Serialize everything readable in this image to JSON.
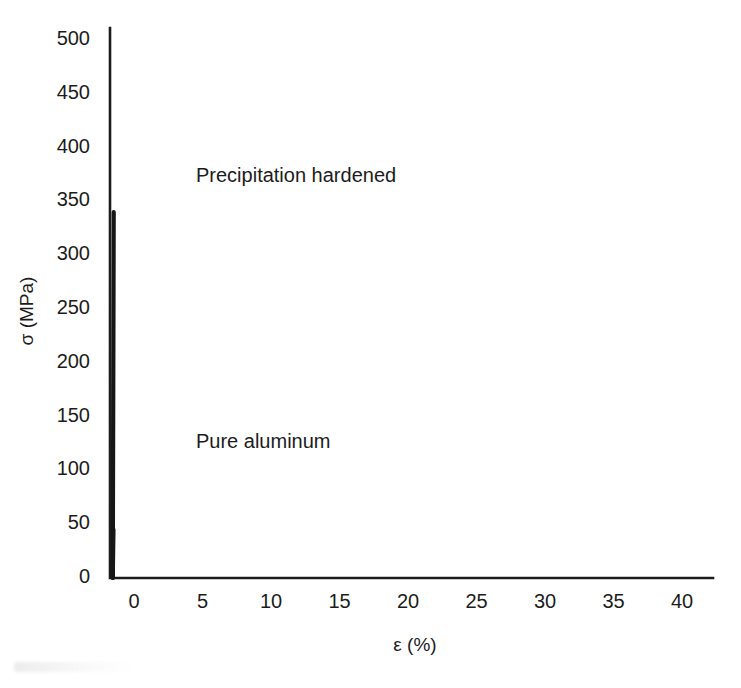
{
  "chart_data": {
    "type": "line",
    "title": "",
    "xlabel": "ε (%)",
    "ylabel": "σ (MPa)",
    "xlim": [
      -1.8,
      42.3
    ],
    "ylim": [
      0,
      512
    ],
    "xticks": [
      0,
      5,
      10,
      15,
      20,
      25,
      30,
      35,
      40
    ],
    "yticks": [
      0,
      50,
      100,
      150,
      200,
      250,
      300,
      350,
      400,
      450,
      500
    ],
    "xtick_labels": [
      "0",
      "5",
      "10",
      "15",
      "20",
      "25",
      "30",
      "35",
      "40"
    ],
    "ytick_labels": [
      "0",
      "50",
      "100",
      "150",
      "200",
      "250",
      "300",
      "350",
      "400",
      "450",
      "500"
    ],
    "grid": false,
    "legend_position": "inline-annotations",
    "line_color": "#161616",
    "axis_color": "#1c1c1c",
    "series": [
      {
        "name": "Precipitation hardened",
        "label_x": 1.3,
        "label_y": 392,
        "yield_strength": 340,
        "tensile_strength": 488,
        "strain_at_peak": 14.0,
        "fracture_strain": 20.7,
        "fracture_stress": 443,
        "points": [
          [
            -1.55,
            0
          ],
          [
            -1.48,
            340
          ],
          [
            -0.6,
            352
          ],
          [
            0.6,
            375
          ],
          [
            1.8,
            398
          ],
          [
            3.0,
            419
          ],
          [
            4.3,
            439
          ],
          [
            5.7,
            456
          ],
          [
            7.2,
            469
          ],
          [
            8.8,
            478
          ],
          [
            10.5,
            484
          ],
          [
            12.2,
            487
          ],
          [
            14.0,
            488
          ],
          [
            15.6,
            485
          ],
          [
            17.0,
            478
          ],
          [
            18.3,
            468
          ],
          [
            19.5,
            457
          ],
          [
            20.7,
            443
          ]
        ]
      },
      {
        "name": "Pure aluminum",
        "label_x": 1.3,
        "label_y": 124,
        "yield_strength": 45,
        "tensile_strength": 106,
        "strain_at_peak": 23.4,
        "fracture_strain": 39.7,
        "fracture_stress": 41,
        "points": [
          [
            -1.55,
            0
          ],
          [
            -1.5,
            45
          ],
          [
            0.0,
            48
          ],
          [
            2.5,
            54
          ],
          [
            5.0,
            61
          ],
          [
            7.5,
            68
          ],
          [
            10.0,
            76
          ],
          [
            12.5,
            83
          ],
          [
            15.0,
            90
          ],
          [
            17.5,
            97
          ],
          [
            20.0,
            102
          ],
          [
            22.0,
            105
          ],
          [
            23.4,
            106
          ],
          [
            25.0,
            105
          ],
          [
            27.0,
            102
          ],
          [
            29.0,
            97
          ],
          [
            31.0,
            90
          ],
          [
            33.0,
            81
          ],
          [
            35.0,
            71
          ],
          [
            37.0,
            59
          ],
          [
            39.7,
            41
          ]
        ]
      }
    ]
  },
  "annotations": {
    "precipitation_label": "Precipitation hardened",
    "pure_aluminum_label": "Pure aluminum"
  }
}
